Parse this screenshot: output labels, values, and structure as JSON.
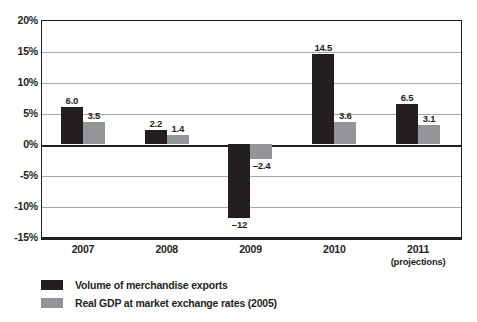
{
  "chart_data": {
    "type": "bar",
    "title": "",
    "subtitle": "",
    "xlabel": "",
    "ylabel": "",
    "categories": [
      "2007",
      "2008",
      "2009",
      "2010",
      "2011"
    ],
    "category_sublabels": [
      "",
      "",
      "",
      "",
      "(projections)"
    ],
    "ylim": [
      -15,
      20
    ],
    "ytick_values": [
      20,
      15,
      10,
      5,
      0,
      -5,
      -10,
      -15
    ],
    "ytick_labels": [
      "20%",
      "15%",
      "10%",
      "5%",
      "0%",
      "-5%",
      "-10%",
      "-15%"
    ],
    "grid": true,
    "grid_axis": "y",
    "legend_position": "below",
    "series": [
      {
        "name": "Volume of merchandise exports",
        "color": "#231f20",
        "values": [
          6.0,
          2.2,
          -12,
          14.5,
          6.5
        ],
        "labels": [
          "6.0",
          "2.2",
          "–12",
          "14.5",
          "6.5"
        ]
      },
      {
        "name": "Real GDP at market exchange rates (2005)",
        "color": "#939598",
        "values": [
          3.5,
          1.4,
          -2.4,
          3.6,
          3.1
        ],
        "labels": [
          "3.5",
          "1.4",
          "–2.4",
          "3.6",
          "3.1"
        ]
      }
    ]
  }
}
